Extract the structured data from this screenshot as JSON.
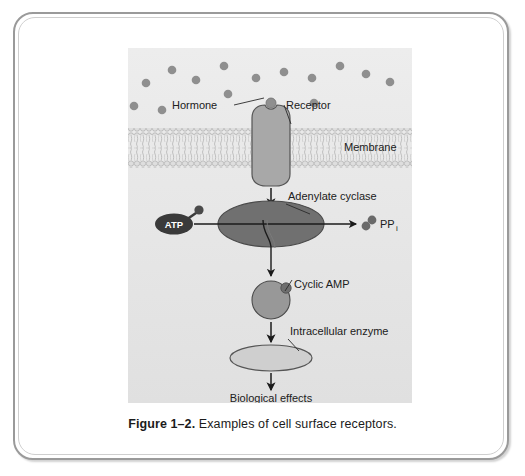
{
  "figure": {
    "caption_label": "Figure 1–2.",
    "caption_text": "Examples of cell surface receptors.",
    "panel_background": "#e6e6e6"
  },
  "labels": {
    "hormone": "Hormone",
    "receptor": "Receptor",
    "membrane": "Membrane",
    "adenylate_cyclase": "Adenylate cyclase",
    "atp": "ATP",
    "ppi": "PP",
    "ppi_subscript": "i",
    "cyclic_amp": "Cyclic AMP",
    "intracellular_enzyme": "Intracellular enzyme",
    "biological_effects": "Biological effects"
  },
  "colors": {
    "frame_border": "#9a9a9a",
    "receptor_fill": "#a8a8a8",
    "receptor_stroke": "#555555",
    "hormone_dot": "#8f8f8f",
    "cyclase_fill": "#707070",
    "cyclase_stroke": "#4a4a4a",
    "camp_fill": "#989898",
    "camp_stroke": "#4a4a4a",
    "enzyme_fill": "#cfcfcf",
    "enzyme_stroke": "#555555",
    "atp_fill": "#3a3a3a",
    "ppi_fill": "#6a6a6a",
    "membrane_head": "#cfcfcf",
    "membrane_tail": "#dcdcdc",
    "arrow": "#1b1b1b",
    "text": "#202020"
  },
  "diagram": {
    "type": "cell-signaling-pathway",
    "hormone_dots": [
      {
        "x": 18,
        "y": 35
      },
      {
        "x": 44,
        "y": 22
      },
      {
        "x": 68,
        "y": 32
      },
      {
        "x": 96,
        "y": 18
      },
      {
        "x": 100,
        "y": 46
      },
      {
        "x": 128,
        "y": 30
      },
      {
        "x": 156,
        "y": 24
      },
      {
        "x": 184,
        "y": 30
      },
      {
        "x": 186,
        "y": 55
      },
      {
        "x": 212,
        "y": 18
      },
      {
        "x": 238,
        "y": 26
      },
      {
        "x": 262,
        "y": 34
      },
      {
        "x": 6,
        "y": 58
      },
      {
        "x": 34,
        "y": 62
      }
    ],
    "membrane": {
      "top": 80,
      "bottom": 120,
      "leaflets": 2
    },
    "receptor": {
      "x": 118,
      "y": 58,
      "width": 44,
      "height": 78
    },
    "bound_hormone": {
      "x": 140,
      "y": 60
    },
    "cyclase": {
      "cx": 140,
      "cy": 168,
      "rx": 52,
      "ry": 23
    },
    "camp": {
      "cx": 140,
      "cy": 243,
      "r": 19
    },
    "enzyme": {
      "cx": 140,
      "cy": 297,
      "rx": 40,
      "ry": 13
    },
    "flow": [
      "Hormone binds Receptor",
      "Receptor activates Adenylate cyclase",
      "ATP converted to Cyclic AMP + PPi",
      "Cyclic AMP activates Intracellular enzyme",
      "Intracellular enzyme produces Biological effects"
    ]
  }
}
